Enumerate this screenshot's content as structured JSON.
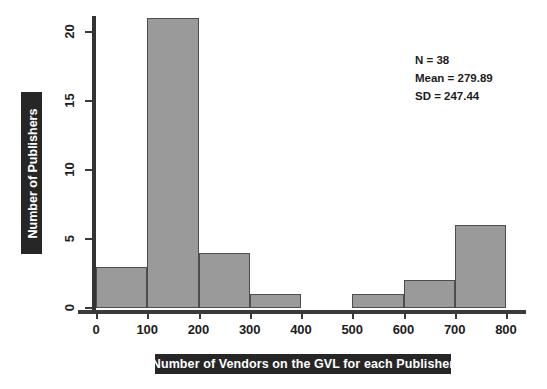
{
  "chart_data": {
    "type": "bar",
    "title": "",
    "subtitle": "",
    "xlabel": "Number of Vendors on the GVL for each Publisher",
    "ylabel": "Number of Publishers",
    "xlim": [
      0,
      800
    ],
    "ylim": [
      0,
      21
    ],
    "grid": false,
    "legend": null,
    "bin_width": 100,
    "categories": [
      "0-100",
      "100-200",
      "200-300",
      "300-400",
      "400-500",
      "500-600",
      "600-700",
      "700-800"
    ],
    "bin_edges": [
      0,
      100,
      200,
      300,
      400,
      500,
      600,
      700,
      800
    ],
    "values": [
      3,
      21,
      4,
      1,
      0,
      1,
      2,
      6
    ],
    "xticks": [
      "0",
      "100",
      "200",
      "300",
      "400",
      "500",
      "600",
      "700",
      "800"
    ],
    "xtick_values": [
      0,
      100,
      200,
      300,
      400,
      500,
      600,
      700,
      800
    ],
    "yticks": [
      "0",
      "5",
      "10",
      "15",
      "20"
    ],
    "ytick_values": [
      0,
      5,
      10,
      15,
      20
    ],
    "bar_color": "#9a9a9a",
    "bar_edge_color": "#4d4d4d",
    "axis_color": "#3a3a3a",
    "label_bar_color": "#262626",
    "label_text_color": "#ffffff",
    "annotations": [
      "N = 38",
      "Mean = 279.89",
      "SD = 247.44"
    ]
  },
  "stats": {
    "n": "N = 38",
    "mean": "Mean = 279.89",
    "sd": "SD = 247.44"
  }
}
